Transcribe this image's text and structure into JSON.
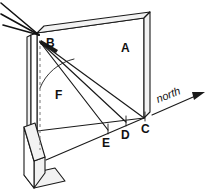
{
  "figure": {
    "type": "technical-line-diagram",
    "background_color": "#ffffff",
    "ink_color": "#1a1a1a"
  },
  "labels": {
    "a": "A",
    "b": "B",
    "c": "C",
    "d": "D",
    "e": "E",
    "f": "F",
    "north": "north"
  },
  "geometry": {
    "panel": {
      "name": "vertical-panel",
      "face_points": "37,33 144,18 144,118 37,131",
      "top_band_points": "37,33 44,26 150,12 144,18",
      "right_band_points": "144,18 150,12 150,112 144,118"
    },
    "post": {
      "name": "left-vertical-post",
      "front_points": "31,35 37,33 37,131 31,133",
      "side_points": "27,37 31,35 31,133 27,135"
    },
    "base_wedge": {
      "name": "triangular-base-support",
      "top_points": "24,127 35,123 45,157 34,161",
      "face_points": "24,127 24,175 34,188 34,161",
      "side_points": "34,161 45,157 45,173 34,188",
      "bottom_points": "24,175 34,188 65,181 55,168"
    },
    "ground_line": {
      "name": "ground-base-line",
      "from": "46,160",
      "to": "144,118"
    },
    "vertex_b": {
      "x": 38,
      "y": 34
    },
    "dashed_plumb": {
      "x1": 40,
      "y1": 40,
      "x2": 40,
      "y2": 148
    },
    "angle_arc": {
      "name": "angle-f-arc",
      "path": "M 40,86 A 46,46 0 0 1 72,58"
    }
  },
  "incoming_rays": [
    {
      "name": "incoming-ray-1",
      "x1": 0,
      "y1": 4,
      "x2": 38,
      "y2": 34
    },
    {
      "name": "incoming-ray-2",
      "x1": 1,
      "y1": 14,
      "x2": 38,
      "y2": 34
    },
    {
      "name": "incoming-ray-3",
      "x1": 3,
      "y1": 24,
      "x2": 38,
      "y2": 34
    }
  ],
  "shadow_lines": [
    {
      "name": "shadow-line-bc",
      "to_label": "C",
      "x1": 40,
      "y1": 42,
      "x2": 144,
      "y2": 118
    },
    {
      "name": "shadow-line-bd",
      "to_label": "D",
      "x1": 40,
      "y1": 42,
      "x2": 126,
      "y2": 122
    },
    {
      "name": "shadow-line-be",
      "to_label": "E",
      "x1": 40,
      "y1": 42,
      "x2": 108,
      "y2": 130
    }
  ],
  "tick_marks": [
    {
      "name": "tick-at-d",
      "x1": 126,
      "y1": 116,
      "x2": 126,
      "y2": 124
    },
    {
      "name": "tick-at-e",
      "x1": 108,
      "y1": 124,
      "x2": 108,
      "y2": 132
    },
    {
      "name": "tick-at-c",
      "x1": 144,
      "y1": 112,
      "x2": 144,
      "y2": 120
    }
  ],
  "label_positions": {
    "a": {
      "x": 121,
      "y": 52
    },
    "b": {
      "x": 46,
      "y": 47
    },
    "c": {
      "x": 141,
      "y": 132
    },
    "d": {
      "x": 122,
      "y": 138
    },
    "e": {
      "x": 103,
      "y": 146
    },
    "f": {
      "x": 56,
      "y": 98
    },
    "north": {
      "x": 158,
      "y": 101
    }
  },
  "north_arrow": {
    "name": "north-direction-arrow",
    "x1": 152,
    "y1": 115,
    "x2": 203,
    "y2": 93,
    "label_rotation": -22
  }
}
